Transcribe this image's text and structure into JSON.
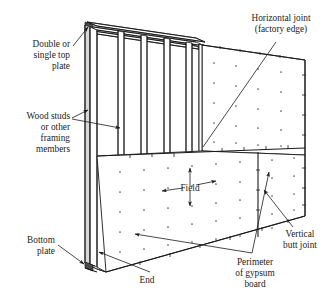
{
  "figure": {
    "background_color": "#ffffff",
    "line_color": "#1a1a1a"
  },
  "labels": {
    "top_plate": {
      "name": "double-or-single-top-plate",
      "lines": [
        "Double or",
        "single top",
        "plate"
      ]
    },
    "wood_studs": {
      "name": "wood-studs-or-other-framing-members",
      "lines": [
        "Wood studs",
        "or other",
        "framing",
        "members"
      ]
    },
    "bottom_plate": {
      "name": "bottom-plate",
      "lines": [
        "Bottom",
        "plate"
      ]
    },
    "end": {
      "name": "end",
      "lines": [
        "End"
      ]
    },
    "field": {
      "name": "field",
      "lines": [
        "Field"
      ]
    },
    "horizontal_joint": {
      "name": "horizontal-joint-factory-edge",
      "lines": [
        "Horizontal joint",
        "(factory edge)"
      ]
    },
    "vertical_butt_joint": {
      "name": "vertical-butt-joint",
      "lines": [
        "Vertical",
        "butt joint"
      ]
    },
    "perimeter": {
      "name": "perimeter-of-gypsum-board",
      "lines": [
        "Perimeter",
        "of gypsum",
        "board"
      ]
    }
  }
}
